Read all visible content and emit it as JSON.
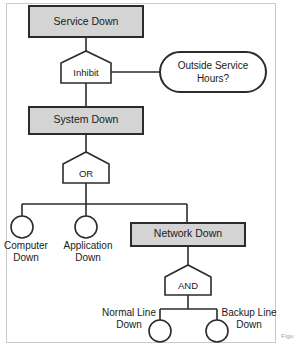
{
  "figure": {
    "type": "fault-tree-diagram",
    "caption_fragment": "Figu",
    "colors": {
      "event_box_fill": "#d4d4d4",
      "event_box_stroke": "#2b2b2b",
      "gate_fill": "#ffffff",
      "gate_stroke": "#2b2b2b",
      "edge": "#2b2b2b",
      "frame_border": "#c9c9c9",
      "background": "#ffffff",
      "text": "#1a1a1a"
    }
  },
  "nodes": {
    "service_down": {
      "label": "Service Down",
      "shape": "rectangle",
      "role": "top-event"
    },
    "inhibit_gate": {
      "label": "Inhibit",
      "shape": "pentagon",
      "role": "gate"
    },
    "outside_service_hours": {
      "label_line1": "Outside Service",
      "label_line2": "Hours?",
      "shape": "stadium",
      "role": "condition"
    },
    "system_down": {
      "label": "System Down",
      "shape": "rectangle",
      "role": "intermediate-event"
    },
    "or_gate": {
      "label": "OR",
      "shape": "pentagon",
      "role": "gate"
    },
    "computer_down": {
      "label_line1": "Computer",
      "label_line2": "Down",
      "shape": "circle",
      "role": "basic-event"
    },
    "application_down": {
      "label_line1": "Application",
      "label_line2": "Down",
      "shape": "circle",
      "role": "basic-event"
    },
    "network_down": {
      "label": "Network Down",
      "shape": "rectangle",
      "role": "intermediate-event"
    },
    "and_gate": {
      "label": "AND",
      "shape": "pentagon",
      "role": "gate"
    },
    "normal_line_down": {
      "label_line1": "Normal Line",
      "label_line2": "Down",
      "shape": "circle",
      "role": "basic-event"
    },
    "backup_line_down": {
      "label_line1": "Backup Line",
      "label_line2": "Down",
      "shape": "circle",
      "role": "basic-event"
    }
  },
  "edges": [
    {
      "from": "service_down",
      "to": "inhibit_gate"
    },
    {
      "from": "inhibit_gate",
      "to": "outside_service_hours"
    },
    {
      "from": "inhibit_gate",
      "to": "system_down"
    },
    {
      "from": "system_down",
      "to": "or_gate"
    },
    {
      "from": "or_gate",
      "to": "computer_down"
    },
    {
      "from": "or_gate",
      "to": "application_down"
    },
    {
      "from": "or_gate",
      "to": "network_down"
    },
    {
      "from": "network_down",
      "to": "and_gate"
    },
    {
      "from": "and_gate",
      "to": "normal_line_down"
    },
    {
      "from": "and_gate",
      "to": "backup_line_down"
    }
  ]
}
